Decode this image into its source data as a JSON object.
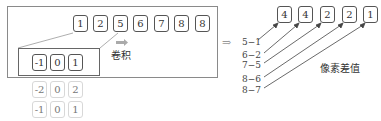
{
  "input_row": {
    "values": [
      "1",
      "2",
      "5",
      "6",
      "7",
      "8",
      "8"
    ]
  },
  "kernel": {
    "rows": [
      [
        "-1",
        "0",
        "1"
      ],
      [
        "-2",
        "0",
        "2"
      ],
      [
        "-1",
        "0",
        "1"
      ]
    ]
  },
  "convolution_label": "卷积",
  "output_row": {
    "values": [
      "4",
      "4",
      "2",
      "2",
      "1"
    ]
  },
  "differences": [
    "5−1",
    "6−2",
    "7−5",
    "8−6",
    "8−7"
  ],
  "pixel_diff_label": "像素差值",
  "arrow_glyph": "⇒"
}
